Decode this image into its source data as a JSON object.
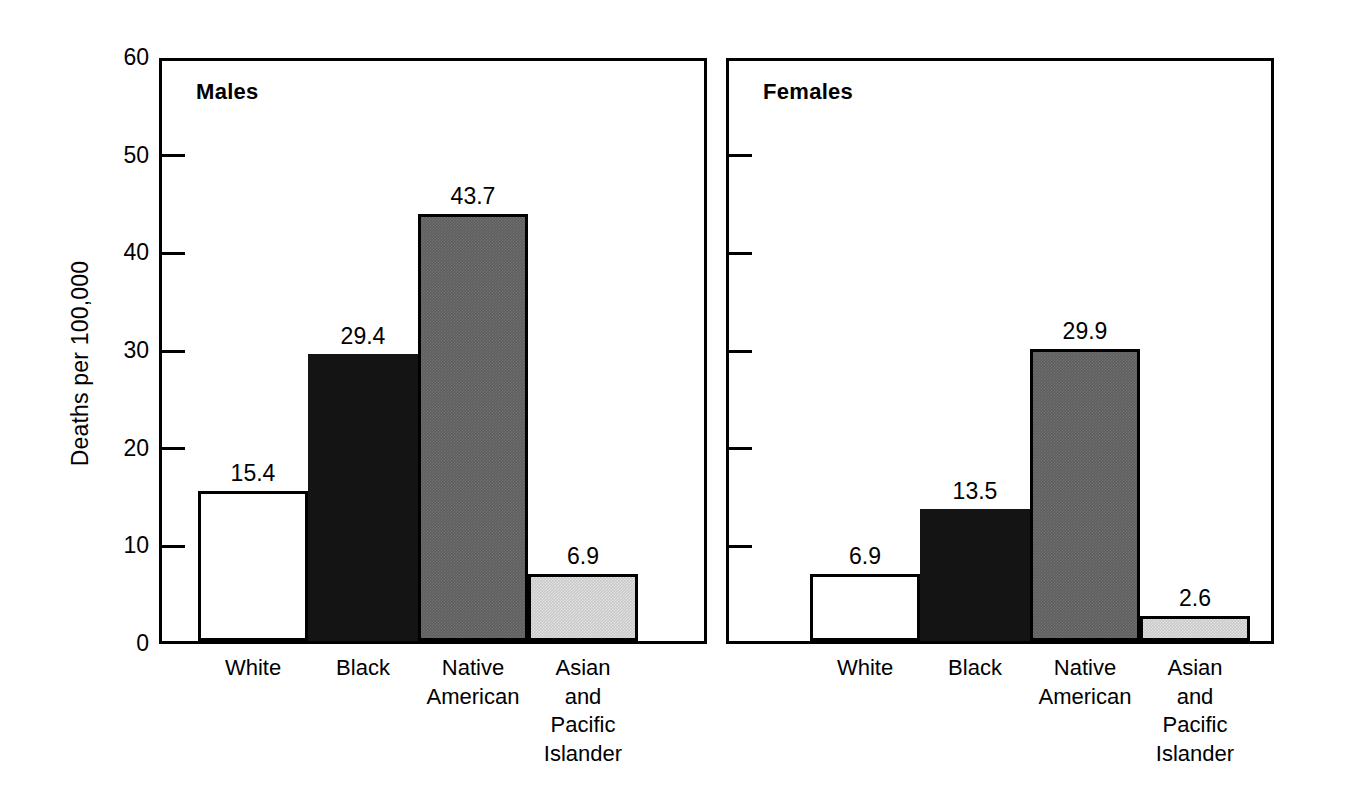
{
  "axis": {
    "ylabel": "Deaths per 100,000",
    "ticks": [
      "0",
      "10",
      "20",
      "30",
      "40",
      "50",
      "60"
    ]
  },
  "panels": [
    {
      "title": "Males",
      "values": [
        "15.4",
        "29.4",
        "43.7",
        "6.9"
      ]
    },
    {
      "title": "Females",
      "values": [
        "6.9",
        "13.5",
        "29.9",
        "2.6"
      ]
    }
  ],
  "categories": [
    "White",
    "Black",
    "Native\nAmerican",
    "Asian\nand\nPacific\nIslander"
  ],
  "colors": {
    "white_bar": "#ffffff",
    "black_bar": "#141414",
    "dark_gray_bar": "#5e5e5e",
    "light_gray_bar": "#c9c9c9",
    "outline": "#000000"
  },
  "chart_data": {
    "type": "bar",
    "title": "",
    "xlabel": "",
    "ylabel": "Deaths per 100,000",
    "ylim": [
      0,
      60
    ],
    "yticks": [
      0,
      10,
      20,
      30,
      40,
      50,
      60
    ],
    "grid": false,
    "legend": "none",
    "panels": [
      "Males",
      "Females"
    ],
    "categories": [
      "White",
      "Black",
      "Native American",
      "Asian and Pacific Islander"
    ],
    "series": [
      {
        "name": "Males",
        "values": [
          15.4,
          29.4,
          43.7,
          6.9
        ]
      },
      {
        "name": "Females",
        "values": [
          6.9,
          13.5,
          29.9,
          2.6
        ]
      }
    ]
  }
}
